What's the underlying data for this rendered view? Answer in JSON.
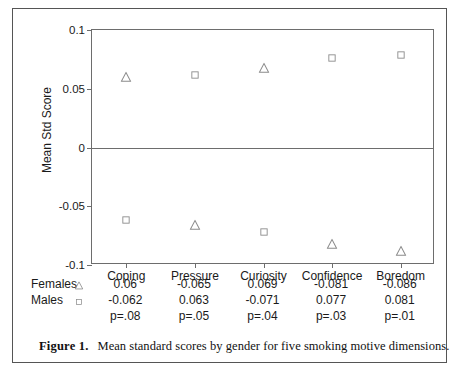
{
  "chart_data": {
    "type": "scatter",
    "title": "",
    "xlabel": "",
    "ylabel": "Mean Std Score",
    "ylim": [
      -0.1,
      0.1
    ],
    "yticks": [
      0.1,
      0.05,
      0,
      -0.05,
      -0.1
    ],
    "ytick_labels": [
      "0.1",
      "0.05",
      "0",
      "-0.05",
      "-0.1"
    ],
    "grid": false,
    "legend_position": "below-left",
    "categories": [
      "Coping",
      "Pressure",
      "Curiosity",
      "Confidence",
      "Boredom"
    ],
    "series": [
      {
        "name": "Females",
        "marker": "triangle",
        "values": [
          0.06,
          -0.065,
          0.069,
          -0.081,
          -0.086
        ],
        "plotted": [
          0.06,
          -0.066,
          0.068,
          -0.082,
          -0.088
        ]
      },
      {
        "name": "Males",
        "marker": "square",
        "values": [
          -0.062,
          0.063,
          -0.071,
          0.077,
          0.081
        ],
        "plotted": [
          -0.062,
          0.062,
          -0.072,
          0.076,
          0.079
        ]
      }
    ],
    "p_values": [
      "p=.08",
      "p=.05",
      "p=.04",
      "p=.03",
      "p=.01"
    ],
    "marker_color": "#8c8c8c",
    "axis_color": "#6d6d6d"
  },
  "table": {
    "header": [
      "Coping",
      "Pressure",
      "Curiosity",
      "Confidence",
      "Boredom"
    ],
    "rows": [
      {
        "label": "Females",
        "marker": "triangle-icon",
        "values": [
          "0.06",
          "-0.065",
          "0.069",
          "-0.081",
          "-0.086"
        ]
      },
      {
        "label": "Males",
        "marker": "square-icon",
        "values": [
          "-0.062",
          "0.063",
          "-0.071",
          "0.077",
          "0.081"
        ]
      },
      {
        "label": "",
        "marker": "",
        "values": [
          "p=.08",
          "p=.05",
          "p=.04",
          "p=.03",
          "p=.01"
        ]
      }
    ]
  },
  "caption": {
    "label": "Figure 1.",
    "text": "Mean standard scores by gender for five smoking motive dimensions."
  }
}
